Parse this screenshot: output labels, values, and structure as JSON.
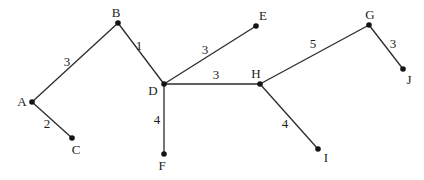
{
  "diagram": {
    "type": "weighted-undirected-graph",
    "background_color": "#ffffff",
    "edge_color": "#2b2b2b",
    "node_color": "#141414",
    "text_color": "#1c1c1c",
    "nodes": [
      {
        "id": "A",
        "label": "A",
        "x": 32,
        "y": 102,
        "label_x": 22,
        "label_y": 101
      },
      {
        "id": "B",
        "label": "B",
        "x": 118,
        "y": 23,
        "label_x": 116,
        "label_y": 12
      },
      {
        "id": "C",
        "label": "C",
        "x": 72,
        "y": 138,
        "label_x": 76,
        "label_y": 149
      },
      {
        "id": "D",
        "label": "D",
        "x": 164,
        "y": 84,
        "label_x": 153,
        "label_y": 90
      },
      {
        "id": "E",
        "label": "E",
        "x": 256,
        "y": 26,
        "label_x": 263,
        "label_y": 15
      },
      {
        "id": "F",
        "label": "F",
        "x": 164,
        "y": 154,
        "label_x": 162,
        "label_y": 165
      },
      {
        "id": "G",
        "label": "G",
        "x": 369,
        "y": 25,
        "label_x": 370,
        "label_y": 14
      },
      {
        "id": "H",
        "label": "H",
        "x": 260,
        "y": 84,
        "label_x": 256,
        "label_y": 73
      },
      {
        "id": "I",
        "label": "I",
        "x": 318,
        "y": 149,
        "label_x": 326,
        "label_y": 157
      },
      {
        "id": "J",
        "label": "J",
        "x": 403,
        "y": 69,
        "label_x": 409,
        "label_y": 79
      }
    ],
    "edges": [
      {
        "from": "A",
        "to": "B",
        "weight": "3",
        "label_x": 67,
        "label_y": 61
      },
      {
        "from": "A",
        "to": "C",
        "weight": "2",
        "label_x": 47,
        "label_y": 123
      },
      {
        "from": "B",
        "to": "D",
        "weight": "1",
        "label_x": 139,
        "label_y": 45
      },
      {
        "from": "D",
        "to": "E",
        "weight": "3",
        "label_x": 205,
        "label_y": 49
      },
      {
        "from": "D",
        "to": "H",
        "weight": "3",
        "label_x": 216,
        "label_y": 74
      },
      {
        "from": "D",
        "to": "F",
        "weight": "4",
        "label_x": 157,
        "label_y": 119
      },
      {
        "from": "H",
        "to": "G",
        "weight": "5",
        "label_x": 313,
        "label_y": 43
      },
      {
        "from": "H",
        "to": "I",
        "weight": "4",
        "label_x": 285,
        "label_y": 123
      },
      {
        "from": "G",
        "to": "J",
        "weight": "3",
        "label_x": 393,
        "label_y": 43
      }
    ]
  }
}
